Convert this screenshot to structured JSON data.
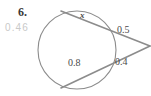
{
  "problem": {
    "number_label": "6.",
    "answer_hint": "0.46"
  },
  "figure": {
    "type": "circle-with-two-secants",
    "labels": {
      "unknown_segment": "x",
      "upper_external_segment": "0.5",
      "lower_chord": "0.8",
      "lower_external_segment": "0.4"
    },
    "colors": {
      "stroke": "#8c8c8c",
      "text": "#4a4a4a",
      "faint_text": "#c9c9c9",
      "number_text": "#3a3a3a",
      "background": "#ffffff"
    },
    "geometry": {
      "circle_center_x": 77,
      "circle_center_y": 50,
      "circle_radius": 39,
      "vertex_x": 150,
      "vertex_y": 46,
      "upper_secant_far_x": 61,
      "upper_secant_far_y": 11,
      "lower_secant_far_x": 61,
      "lower_secant_far_y": 88
    }
  }
}
